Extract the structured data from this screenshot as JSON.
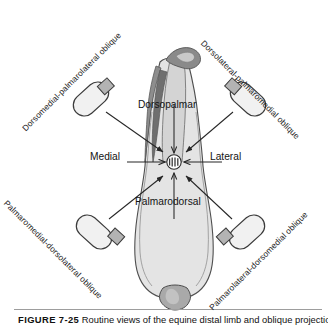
{
  "figure": {
    "caption_number": "FIGURE 7-25",
    "caption_text": "Routine views of the equine distal limb and oblique projections.",
    "width": 336,
    "height": 326
  },
  "colors": {
    "background": "#ffffff",
    "limb_fill": "#e2e2e2",
    "limb_stroke": "#4a4a4a",
    "tendon_fill": "#9a9a9a",
    "tendon_dark": "#6e6e6e",
    "bone_light": "#d0d0d0",
    "hoof_fill": "#a8a8a8",
    "tube_fill": "#f0f0f0",
    "tube_stroke": "#3c3c3c",
    "collimator_fill": "#b4b4b4",
    "beam_stroke": "#2b2b2b",
    "hub_fill": "#8d8d8d",
    "text": "#131313"
  },
  "diagram": {
    "type": "radiographic-projection-schematic",
    "subject": "equine distal limb",
    "center_hub": {
      "x": 174,
      "y": 162,
      "r": 7
    },
    "orthogonal_views": [
      {
        "id": "dorsopalmar",
        "label": "Dorsopalmar",
        "direction": "top-to-bottom",
        "arrow": {
          "x1": 174,
          "y1": 104,
          "x2": 174,
          "y2": 154
        }
      },
      {
        "id": "palmarodorsal",
        "label": "Palmarodorsal",
        "direction": "bottom-to-top",
        "arrow": {
          "x1": 174,
          "y1": 219,
          "x2": 174,
          "y2": 172
        }
      },
      {
        "id": "medial",
        "label": "Medial",
        "direction": "left-to-right",
        "arrow": {
          "x1": 127,
          "y1": 162,
          "x2": 166,
          "y2": 162
        }
      },
      {
        "id": "lateral",
        "label": "Lateral",
        "direction": "right-to-left",
        "arrow": {
          "x1": 222,
          "y1": 162,
          "x2": 183,
          "y2": 162
        }
      }
    ],
    "oblique_views": [
      {
        "id": "dorsomedial-palmarolateral-oblique",
        "label": "Dorsomedial-palmarolateral oblique",
        "corner": "top-left",
        "rotation_deg": -45,
        "tube": {
          "cx": 91,
          "cy": 99,
          "rx": 20,
          "ry": 11,
          "rot": -42
        },
        "beam": {
          "x1": 104,
          "y1": 111,
          "x2": 160,
          "y2": 150
        }
      },
      {
        "id": "dorsolateral-palmaromedial-oblique",
        "label": "Dorsolateral-palmaromedial oblique",
        "corner": "top-right",
        "rotation_deg": 45,
        "tube": {
          "cx": 248,
          "cy": 99,
          "rx": 20,
          "ry": 11,
          "rot": 42
        },
        "beam": {
          "x1": 235,
          "y1": 111,
          "x2": 189,
          "y2": 150
        }
      },
      {
        "id": "palmaromedial-dorsolateral-oblique",
        "label": "Palmaromedial-dorsolateral oblique",
        "corner": "bottom-left",
        "rotation_deg": 45,
        "tube": {
          "cx": 94,
          "cy": 232,
          "rx": 20,
          "ry": 11,
          "rot": 42
        },
        "beam": {
          "x1": 107,
          "y1": 220,
          "x2": 160,
          "y2": 176
        }
      },
      {
        "id": "palmarolateral-dorsomedial-oblique",
        "label": "Palmarolateral-dorsomedial oblique",
        "corner": "bottom-right",
        "rotation_deg": -45,
        "tube": {
          "cx": 247,
          "cy": 232,
          "rx": 20,
          "ry": 11,
          "rot": -42
        },
        "beam": {
          "x1": 234,
          "y1": 220,
          "x2": 189,
          "y2": 176
        }
      }
    ]
  }
}
